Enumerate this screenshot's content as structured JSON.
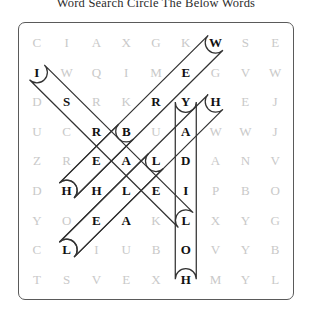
{
  "title": "Word Search Circle The Below Words",
  "puzzle": {
    "rows": 9,
    "cols": 9,
    "letter_color": "#c9c9c9",
    "found_letter_color": "#111111",
    "border_color": "#5a5a5a",
    "mark_color": "#333333",
    "grid": [
      [
        "C",
        "I",
        "A",
        "X",
        "G",
        "K",
        "W",
        "S",
        "E"
      ],
      [
        "I",
        "W",
        "Q",
        "I",
        "M",
        "E",
        "G",
        "V",
        "W"
      ],
      [
        "D",
        "S",
        "R",
        "K",
        "R",
        "Y",
        "H",
        "E",
        "J"
      ],
      [
        "U",
        "C",
        "R",
        "B",
        "U",
        "A",
        "W",
        "W",
        "J"
      ],
      [
        "Z",
        "R",
        "E",
        "A",
        "L",
        "D",
        "A",
        "N",
        "V"
      ],
      [
        "D",
        "H",
        "H",
        "L",
        "E",
        "I",
        "P",
        "B",
        "O"
      ],
      [
        "Y",
        "O",
        "E",
        "A",
        "K",
        "L",
        "X",
        "Y",
        "G"
      ],
      [
        "C",
        "L",
        "I",
        "U",
        "B",
        "O",
        "V",
        "Y",
        "B"
      ],
      [
        "T",
        "S",
        "V",
        "E",
        "X",
        "H",
        "M",
        "Y",
        "L"
      ]
    ],
    "found_cells": [
      [
        0,
        6
      ],
      [
        1,
        5
      ],
      [
        2,
        4
      ],
      [
        3,
        3
      ],
      [
        4,
        2
      ],
      [
        5,
        1
      ],
      [
        1,
        0
      ],
      [
        2,
        1
      ],
      [
        3,
        2
      ],
      [
        4,
        3
      ],
      [
        5,
        4
      ],
      [
        6,
        5
      ],
      [
        2,
        5
      ],
      [
        3,
        5
      ],
      [
        4,
        5
      ],
      [
        5,
        5
      ],
      [
        6,
        5
      ],
      [
        7,
        5
      ],
      [
        8,
        5
      ],
      [
        2,
        6
      ],
      [
        3,
        5
      ],
      [
        4,
        4
      ],
      [
        5,
        3
      ],
      [
        6,
        2
      ],
      [
        7,
        1
      ],
      [
        3,
        2
      ],
      [
        4,
        2
      ],
      [
        5,
        2
      ],
      [
        4,
        3
      ],
      [
        5,
        4
      ],
      [
        6,
        3
      ]
    ],
    "circled_words": [
      {
        "name": "diagonal-down-left-from-w",
        "start": [
          0,
          6
        ],
        "end": [
          5,
          1
        ]
      },
      {
        "name": "diagonal-down-right-from-i",
        "start": [
          1,
          0
        ],
        "end": [
          6,
          5
        ]
      },
      {
        "name": "vertical-column-six",
        "start": [
          2,
          5
        ],
        "end": [
          8,
          5
        ]
      },
      {
        "name": "diagonal-down-left-from-h",
        "start": [
          2,
          6
        ],
        "end": [
          7,
          1
        ]
      },
      {
        "name": "diagonal-up-right-from-h",
        "start": [
          5,
          1
        ],
        "end": [
          3,
          3
        ]
      },
      {
        "name": "diagonal-up-right-from-l",
        "start": [
          7,
          1
        ],
        "end": [
          4,
          4
        ]
      }
    ]
  }
}
